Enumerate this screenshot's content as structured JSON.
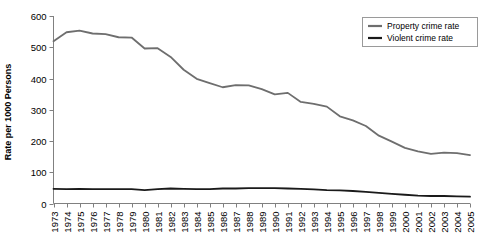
{
  "chart_data": {
    "type": "line",
    "title": "",
    "xlabel": "",
    "ylabel": "Rate per 1000 Persons",
    "ylim": [
      0,
      600
    ],
    "yticks": [
      0,
      100,
      200,
      300,
      400,
      500,
      600
    ],
    "grid": false,
    "legend_position": "top-right",
    "x": [
      1973,
      1974,
      1975,
      1976,
      1977,
      1978,
      1979,
      1980,
      1981,
      1982,
      1983,
      1984,
      1985,
      1986,
      1987,
      1988,
      1989,
      1990,
      1991,
      1992,
      1993,
      1994,
      1995,
      1996,
      1997,
      1998,
      1999,
      2000,
      2001,
      2002,
      2003,
      2004,
      2005
    ],
    "categories": [
      "1973",
      "1974",
      "1975",
      "1976",
      "1977",
      "1978",
      "1979",
      "1980",
      "1981",
      "1982",
      "1983",
      "1984",
      "1985",
      "1986",
      "1987",
      "1988",
      "1989",
      "1990",
      "1991",
      "1992",
      "1993",
      "1994",
      "1995",
      "1996",
      "1997",
      "1998",
      "1999",
      "2000",
      "2001",
      "2002",
      "2003",
      "2004",
      "2005"
    ],
    "series": [
      {
        "name": "Property crime rate",
        "color": "#6e6e6e",
        "values": [
          519,
          548,
          553,
          544,
          542,
          532,
          531,
          496,
          497,
          469,
          428,
          399,
          385,
          372,
          379,
          378,
          366,
          349,
          354,
          325,
          319,
          310,
          279,
          266,
          248,
          217,
          198,
          178,
          167,
          159,
          163,
          161,
          155
        ]
      },
      {
        "name": "Violent crime rate",
        "color": "#1a1a1a",
        "values": [
          47,
          46,
          47,
          46,
          46,
          46,
          46,
          43,
          46,
          48,
          47,
          46,
          46,
          48,
          48,
          49,
          49,
          49,
          48,
          47,
          45,
          43,
          42,
          40,
          37,
          34,
          31,
          28,
          25,
          24,
          24,
          23,
          22
        ]
      }
    ]
  },
  "legend": {
    "items": [
      {
        "label": "Property crime rate",
        "color": "#6e6e6e"
      },
      {
        "label": "Violent crime rate",
        "color": "#1a1a1a"
      }
    ]
  },
  "axis": {
    "y_title": "Rate per 1000 Persons",
    "y_tick_labels": [
      "600",
      "500",
      "400",
      "300",
      "200",
      "100",
      "0"
    ],
    "x_tick_labels": [
      "1973",
      "1974",
      "1975",
      "1976",
      "1977",
      "1978",
      "1979",
      "1980",
      "1981",
      "1982",
      "1983",
      "1984",
      "1985",
      "1986",
      "1987",
      "1988",
      "1989",
      "1990",
      "1991",
      "1992",
      "1993",
      "1994",
      "1995",
      "1996",
      "1997",
      "1998",
      "1999",
      "2000",
      "2001",
      "2002",
      "2003",
      "2004",
      "2005"
    ]
  },
  "colors": {
    "property": "#6e6e6e",
    "violent": "#1a1a1a",
    "axis": "#808080",
    "legend_border": "#9a9a9a",
    "background": "#ffffff"
  }
}
